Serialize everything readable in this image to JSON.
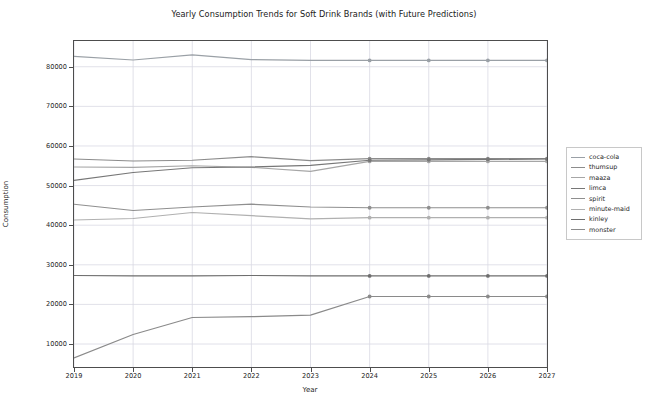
{
  "chart_data": {
    "type": "line",
    "title": "Yearly Consumption Trends for Soft Drink Brands (with Future Predictions)",
    "xlabel": "Year",
    "ylabel": "Consumption",
    "grid": true,
    "legend_position": "center right (outside axes)",
    "x": [
      2019,
      2020,
      2021,
      2022,
      2023,
      2024,
      2025,
      2026,
      2027
    ],
    "xtick_labels": [
      "2019",
      "2020",
      "2021",
      "2022",
      "2023",
      "2024",
      "2025",
      "2026",
      "2027"
    ],
    "ytick_labels": [
      "10000",
      "20000",
      "30000",
      "40000",
      "50000",
      "60000",
      "70000",
      "80000"
    ],
    "yticks": [
      10000,
      20000,
      30000,
      40000,
      50000,
      60000,
      70000,
      80000
    ],
    "xlim": [
      2019,
      2027
    ],
    "ylim": [
      4200,
      86500
    ],
    "prediction_start_year": 2024,
    "marker_years": [
      2024,
      2025,
      2026,
      2027
    ],
    "series": [
      {
        "name": "coca-cola",
        "color": "#9aa0a6",
        "values": [
          82600,
          81700,
          83000,
          81800,
          81600,
          81600,
          81600,
          81600,
          81600
        ]
      },
      {
        "name": "thumsup",
        "color": "#8c8c8c",
        "values": [
          56700,
          56200,
          56400,
          57300,
          56300,
          56800,
          56800,
          56800,
          56800
        ]
      },
      {
        "name": "maaza",
        "color": "#a6a6a6",
        "values": [
          54700,
          54600,
          55000,
          54600,
          53600,
          56100,
          56100,
          56100,
          56100
        ]
      },
      {
        "name": "limca",
        "color": "#777777",
        "values": [
          51300,
          53300,
          54500,
          54700,
          55100,
          56400,
          56500,
          56600,
          56700
        ]
      },
      {
        "name": "spirit",
        "color": "#8f8f8f",
        "values": [
          45300,
          43700,
          44600,
          45300,
          44600,
          44400,
          44400,
          44400,
          44400
        ]
      },
      {
        "name": "minute-maid",
        "color": "#b0b0b0",
        "values": [
          41300,
          41700,
          43200,
          42400,
          41600,
          41900,
          41900,
          41900,
          41900
        ]
      },
      {
        "name": "kinley",
        "color": "#6e6e6e",
        "values": [
          27300,
          27200,
          27200,
          27300,
          27200,
          27200,
          27200,
          27200,
          27200
        ]
      },
      {
        "name": "monster",
        "color": "#8a8a8a",
        "values": [
          6500,
          12400,
          16700,
          16900,
          17300,
          22000,
          22000,
          22000,
          22000
        ]
      }
    ]
  },
  "legend": {
    "items": [
      {
        "label": "coca-cola"
      },
      {
        "label": "thumsup"
      },
      {
        "label": "maaza"
      },
      {
        "label": "limca"
      },
      {
        "label": "spirit"
      },
      {
        "label": "minute-maid"
      },
      {
        "label": "kinley"
      },
      {
        "label": "monster"
      }
    ]
  },
  "style": {
    "grid_color": "#d9d9e3",
    "axis_color": "#4d4d4d",
    "background": "#ffffff"
  }
}
